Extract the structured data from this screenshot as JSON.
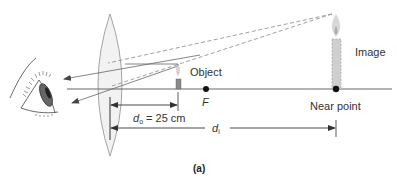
{
  "figure": {
    "caption": "(a)",
    "labels": {
      "object": "Object",
      "image": "Image",
      "focal_point": "F",
      "near_point": "Near point",
      "do_symbol": "d",
      "do_subscript": "o",
      "do_value": " = 25 cm",
      "di_symbol": "d",
      "di_subscript": "i"
    },
    "elements": {
      "eye": "eye-icon",
      "lens": "converging-lens",
      "object_candle": "small-candle",
      "image_candle": "virtual-image-candle"
    },
    "colors": {
      "line": "#555555",
      "lens_fill": "#f2f2f2",
      "lens_stroke": "#9a9a9a",
      "candle_body": "#8a8a8a",
      "image_body": "#c8c8c8",
      "flame": "#d8d8d8",
      "dot": "#111111",
      "text": "#333333"
    }
  }
}
